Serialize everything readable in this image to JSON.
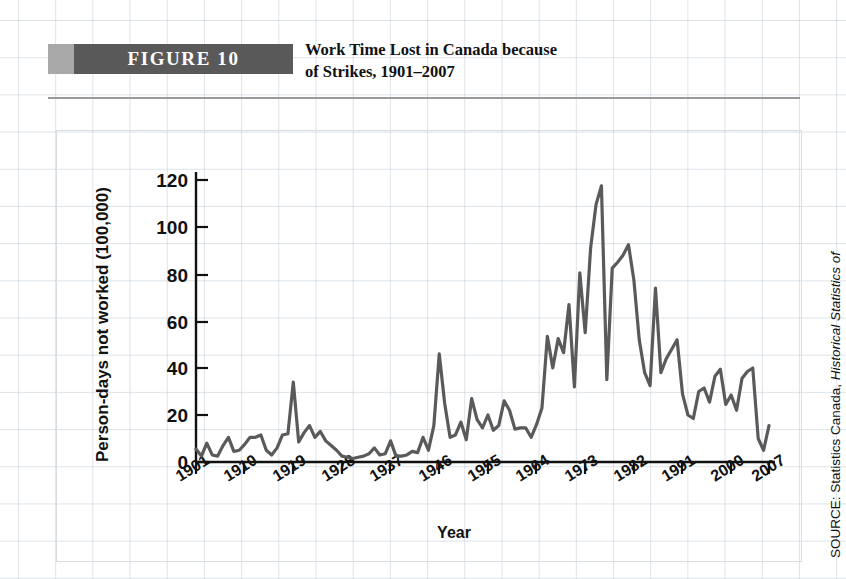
{
  "figure": {
    "banner_label": "FIGURE 10",
    "title_line1": "Work Time Lost in Canada because",
    "title_line2": "of Strikes, 1901–2007",
    "banner_color_cap": "#a8a8a8",
    "banner_color_body": "#595959",
    "line_color": "#5a5a5a"
  },
  "source": {
    "prefix": "SOURCE: Statistics Canada, ",
    "italic": "Historical Statistics of"
  },
  "chart_data": {
    "type": "line",
    "title": "Work Time Lost in Canada because of Strikes, 1901–2007",
    "xlabel": "Year",
    "ylabel": "Person-days not worked (100,000)",
    "xlim": [
      1901,
      2007
    ],
    "ylim": [
      0,
      130
    ],
    "yticks": [
      0,
      20,
      40,
      60,
      80,
      100,
      120
    ],
    "xticks": [
      1901,
      1910,
      1919,
      1928,
      1937,
      1946,
      1955,
      1964,
      1973,
      1982,
      1991,
      2000,
      2007
    ],
    "grid": true,
    "legend": null,
    "series": [
      {
        "name": "Person-days not worked (100,000)",
        "x": [
          1901,
          1902,
          1903,
          1904,
          1905,
          1906,
          1907,
          1908,
          1909,
          1910,
          1911,
          1912,
          1913,
          1914,
          1915,
          1916,
          1917,
          1918,
          1919,
          1920,
          1921,
          1922,
          1923,
          1924,
          1925,
          1926,
          1927,
          1928,
          1929,
          1930,
          1931,
          1932,
          1933,
          1934,
          1935,
          1936,
          1937,
          1938,
          1939,
          1940,
          1941,
          1942,
          1943,
          1944,
          1945,
          1946,
          1947,
          1948,
          1949,
          1950,
          1951,
          1952,
          1953,
          1954,
          1955,
          1956,
          1957,
          1958,
          1959,
          1960,
          1961,
          1962,
          1963,
          1964,
          1965,
          1966,
          1967,
          1968,
          1969,
          1970,
          1971,
          1972,
          1973,
          1974,
          1975,
          1976,
          1977,
          1978,
          1979,
          1980,
          1981,
          1982,
          1983,
          1984,
          1985,
          1986,
          1987,
          1988,
          1989,
          1990,
          1991,
          1992,
          1993,
          1994,
          1995,
          1996,
          1997,
          1998,
          1999,
          2000,
          2001,
          2002,
          2003,
          2004,
          2005,
          2006,
          2007
        ],
        "values": [
          5.5,
          2.5,
          8.0,
          3.0,
          2.5,
          7.0,
          10.5,
          4.5,
          5.0,
          7.5,
          10.5,
          10.5,
          11.5,
          5.0,
          3.0,
          6.0,
          11.5,
          12.0,
          34.0,
          8.5,
          12.5,
          15.5,
          10.5,
          13.0,
          9.0,
          7.0,
          5.0,
          2.5,
          2.0,
          1.5,
          2.0,
          2.5,
          3.5,
          6.0,
          3.0,
          3.5,
          9.0,
          2.5,
          2.5,
          3.0,
          4.5,
          4.0,
          10.5,
          5.0,
          15.5,
          46.0,
          25.0,
          10.5,
          11.5,
          17.0,
          9.5,
          27.0,
          18.0,
          14.5,
          20.0,
          13.5,
          15.5,
          26.0,
          22.0,
          14.0,
          14.5,
          14.5,
          10.5,
          16.0,
          23.0,
          53.5,
          40.0,
          52.5,
          46.5,
          67.0,
          32.0,
          80.5,
          55.0,
          91.0,
          109.5,
          117.5,
          35.0,
          82.5,
          85.0,
          88.0,
          92.5,
          77.5,
          52.0,
          38.0,
          32.5,
          74.0,
          38.0,
          44.0,
          48.0,
          52.0,
          29.0,
          20.0,
          18.5,
          30.0,
          31.5,
          25.5,
          36.5,
          39.5,
          24.5,
          28.5,
          22.0,
          35.5,
          38.5,
          40.0,
          10.0,
          5.0,
          15.5
        ]
      }
    ]
  }
}
